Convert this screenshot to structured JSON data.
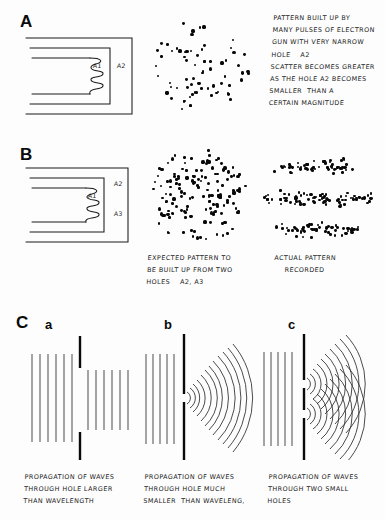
{
  "figure": {
    "background_color": "#fdfdfd",
    "ink_color": "#111111"
  },
  "panels": [
    {
      "id": "A",
      "letter": "A",
      "apparatus": {
        "name": "electron-gun-single-hole",
        "labels": [
          {
            "id": "A1",
            "text": "A1"
          },
          {
            "id": "A2",
            "text": "A2"
          }
        ]
      },
      "pattern": {
        "name": "single-hole-scatter-pattern",
        "kind": "scatter-disc",
        "dot_count": 72
      },
      "caption_lines": [
        "PATTERN BUILT UP BY",
        "MANY PULSES OF ELECTRON",
        "GUN WITH VERY NARROW",
        "HOLE    A2",
        "SCATTER BECOMES GREATER",
        "AS THE HOLE A2 BECOMES",
        "SMALLER  THAN A",
        "CERTAIN MAGNITUDE"
      ]
    },
    {
      "id": "B",
      "letter": "B",
      "apparatus": {
        "name": "electron-gun-two-holes",
        "labels": [
          {
            "id": "A1",
            "text": "A1"
          },
          {
            "id": "A2",
            "text": "A2"
          },
          {
            "id": "A3",
            "text": "A3"
          }
        ]
      },
      "expected": {
        "name": "expected-two-hole-pattern",
        "kind": "scatter-disc",
        "dot_count": 150,
        "caption_lines": [
          "EXPECTED PATTERN TO",
          "BE BUILT UP FROM TWO",
          "HOLES    A2, A3"
        ]
      },
      "actual": {
        "name": "actual-interference-pattern",
        "kind": "banded-fringes",
        "band_count": 3,
        "dot_count": 190,
        "caption_lines": [
          "ACTUAL PATTERN",
          "RECORDED"
        ]
      }
    },
    {
      "id": "C",
      "letter": "C",
      "subpanels": [
        {
          "id": "a",
          "letter": "a",
          "wave_kind": "plane-waves-through-large-hole",
          "caption_lines": [
            "PROPAGATION OF WAVES",
            "THROUGH HOLE LARGER",
            "THAN WAVELENGTH"
          ]
        },
        {
          "id": "b",
          "letter": "b",
          "wave_kind": "circular-waves-single-small-hole",
          "caption_lines": [
            "PROPAGATION OF WAVES",
            "THROUGH HOLE MUCH",
            "SMALLER  THAN WAVELENG,"
          ]
        },
        {
          "id": "c",
          "letter": "c",
          "wave_kind": "circular-waves-two-small-holes",
          "caption_lines": [
            "PROPAGATION OF WAVES",
            "THROUGH TWO SMALL",
            "HOLES"
          ]
        }
      ]
    }
  ]
}
